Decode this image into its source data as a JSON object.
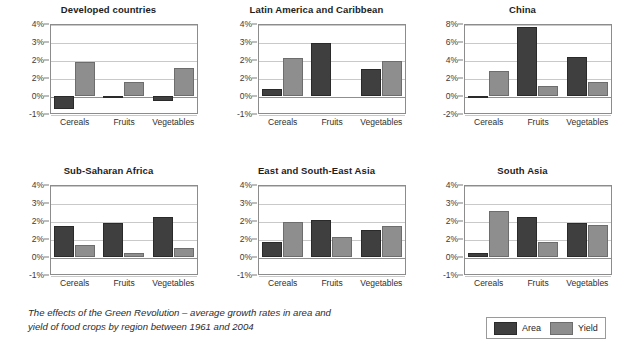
{
  "figure": {
    "caption_line1": "The effects of the Green Revolution – average growth rates in area and",
    "caption_line2": "yield of food crops by region between 1961 and 2004"
  },
  "legend": {
    "position": "bottom-right",
    "items": [
      {
        "label": "Area",
        "color": "#3f3f3f"
      },
      {
        "label": "Yield",
        "color": "#8e8e8e"
      }
    ]
  },
  "chart_data": [
    {
      "type": "bar",
      "title": "Developed countries",
      "categories": [
        "Cereals",
        "Fruits",
        "Vegetables"
      ],
      "series": [
        {
          "name": "Area",
          "values": [
            -0.7,
            -0.05,
            -0.3
          ]
        },
        {
          "name": "Yield",
          "values": [
            1.9,
            0.8,
            1.55
          ]
        }
      ],
      "xlabel": "",
      "ylabel": "",
      "ylim": [
        -1,
        4
      ],
      "yticks": [
        4,
        3,
        2,
        1,
        0,
        -1
      ],
      "yticklabels": [
        "4%",
        "3%",
        "2%",
        "2%",
        "0%",
        "-1%"
      ],
      "grid": true
    },
    {
      "type": "bar",
      "title": "Latin America and Caribbean",
      "categories": [
        "Cereals",
        "Fruits",
        "Vegetables"
      ],
      "series": [
        {
          "name": "Area",
          "values": [
            0.4,
            2.95,
            1.5
          ]
        },
        {
          "name": "Yield",
          "values": [
            2.1,
            0,
            1.95
          ]
        }
      ],
      "xlabel": "",
      "ylabel": "",
      "ylim": [
        -1,
        4
      ],
      "yticks": [
        4,
        3,
        2,
        1,
        0,
        -1
      ],
      "yticklabels": [
        "4%",
        "3%",
        "2%",
        "2%",
        "0%",
        "-1%"
      ],
      "grid": true
    },
    {
      "type": "bar",
      "title": "China",
      "categories": [
        "Cereals",
        "Fruits",
        "Vegetables"
      ],
      "series": [
        {
          "name": "Area",
          "values": [
            -0.15,
            7.7,
            4.3
          ]
        },
        {
          "name": "Yield",
          "values": [
            2.8,
            1.1,
            1.6
          ]
        }
      ],
      "xlabel": "",
      "ylabel": "",
      "ylim": [
        -2,
        8
      ],
      "yticks": [
        8,
        6,
        4,
        2,
        0,
        -2
      ],
      "yticklabels": [
        "8%",
        "6%",
        "4%",
        "2%",
        "0%",
        "-2%"
      ],
      "grid": true
    },
    {
      "type": "bar",
      "title": "Sub-Saharan Africa",
      "categories": [
        "Cereals",
        "Fruits",
        "Vegetables"
      ],
      "series": [
        {
          "name": "Area",
          "values": [
            1.7,
            1.9,
            2.2
          ]
        },
        {
          "name": "Yield",
          "values": [
            0.65,
            0.2,
            0.5
          ]
        }
      ],
      "xlabel": "",
      "ylabel": "",
      "ylim": [
        -1,
        4
      ],
      "yticks": [
        4,
        3,
        2,
        1,
        0,
        -1
      ],
      "yticklabels": [
        "4%",
        "3%",
        "2%",
        "2%",
        "0%",
        "-1%"
      ],
      "grid": true
    },
    {
      "type": "bar",
      "title": "East and South-East Asia",
      "categories": [
        "Cereals",
        "Fruits",
        "Vegetables"
      ],
      "series": [
        {
          "name": "Area",
          "values": [
            0.85,
            2.05,
            1.5
          ]
        },
        {
          "name": "Yield",
          "values": [
            1.95,
            1.1,
            1.7
          ]
        }
      ],
      "xlabel": "",
      "ylabel": "",
      "ylim": [
        -1,
        4
      ],
      "yticks": [
        4,
        3,
        2,
        1,
        0,
        -1
      ],
      "yticklabels": [
        "4%",
        "3%",
        "2%",
        "2%",
        "0%",
        "-1%"
      ],
      "grid": true
    },
    {
      "type": "bar",
      "title": "South Asia",
      "categories": [
        "Cereals",
        "Fruits",
        "Vegetables"
      ],
      "series": [
        {
          "name": "Area",
          "values": [
            0.25,
            2.2,
            1.9
          ]
        },
        {
          "name": "Yield",
          "values": [
            2.55,
            0.85,
            1.8
          ]
        }
      ],
      "xlabel": "",
      "ylabel": "",
      "ylim": [
        -1,
        4
      ],
      "yticks": [
        4,
        3,
        2,
        1,
        0,
        -1
      ],
      "yticklabels": [
        "4%",
        "3%",
        "2%",
        "2%",
        "0%",
        "-1%"
      ],
      "grid": true
    }
  ]
}
